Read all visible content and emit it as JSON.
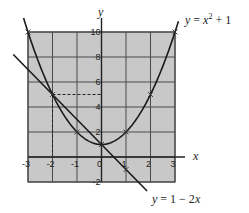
{
  "chart_data": {
    "type": "line",
    "title": "",
    "xlabel": "x",
    "ylabel": "y",
    "xlim": [
      -3,
      3
    ],
    "ylim": [
      -2,
      10
    ],
    "grid": true,
    "grid_color": "#4a4a4a",
    "plot_background": "#c8c8c8",
    "x_ticks": [
      -3,
      -2,
      -1,
      0,
      1,
      2,
      3
    ],
    "y_ticks": [
      -2,
      2,
      4,
      6,
      8,
      10
    ],
    "x_tick_labels": [
      "-3",
      "-2",
      "-1",
      "0",
      "1",
      "2",
      "3"
    ],
    "y_tick_labels": [
      "-2",
      "2",
      "4",
      "6",
      "8",
      "10"
    ],
    "series": [
      {
        "name": "y = x² + 1",
        "equation": "y = x^2 + 1",
        "marked_points": [
          [
            -3,
            10
          ],
          [
            -2,
            5
          ],
          [
            -1,
            2
          ],
          [
            0,
            1
          ],
          [
            1,
            2
          ],
          [
            2,
            5
          ],
          [
            3,
            10
          ]
        ],
        "color": "#1a1a1a"
      },
      {
        "name": "y = 1 − 2x",
        "equation": "y = 1 - 2x",
        "marked_points": [
          [
            1,
            -1
          ]
        ],
        "color": "#1a1a1a"
      }
    ],
    "annotations": [
      {
        "type": "dashed-line",
        "from": [
          -2,
          5
        ],
        "to": [
          0,
          5
        ]
      },
      {
        "type": "dashed-line",
        "from": [
          -2,
          5
        ],
        "to": [
          -2,
          0
        ]
      },
      {
        "type": "intersection",
        "point": [
          -2,
          5
        ]
      },
      {
        "type": "intersection",
        "point": [
          0,
          1
        ]
      }
    ],
    "legend": "inline labels at curve ends"
  },
  "labels": {
    "x_axis": "x",
    "y_axis": "y",
    "parabola": {
      "prefix": "y",
      "mid": " = ",
      "var": "x",
      "sup": "2",
      "suffix": " + 1"
    },
    "line": {
      "prefix": "y",
      "mid": " = 1 − 2",
      "var": "x"
    }
  }
}
